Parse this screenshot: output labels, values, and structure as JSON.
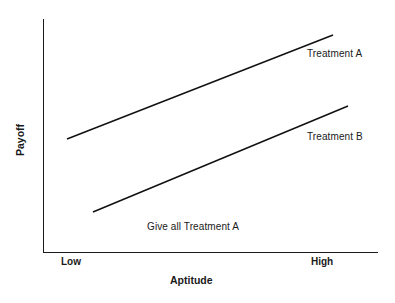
{
  "chart_data": {
    "type": "line",
    "title": "",
    "subtitle": "",
    "xlabel": "Aptitude",
    "ylabel": "Payoff",
    "xtick_labels": [
      "Low",
      "High"
    ],
    "ytick_labels": [],
    "grid": false,
    "legend_position": "inline-right",
    "xlim": [
      0,
      1
    ],
    "ylim": [
      0,
      1
    ],
    "series": [
      {
        "name": "Treatment A",
        "x": [
          0.072,
          0.861
        ],
        "y": [
          0.49,
          0.934
        ],
        "points_px": [
          [
            67,
            139
          ],
          [
            333,
            35
          ]
        ]
      },
      {
        "name": "Treatment B",
        "x": [
          0.149,
          0.905
        ],
        "y": [
          0.18,
          0.633
        ],
        "points_px": [
          [
            93,
            212
          ],
          [
            348,
            106
          ]
        ]
      }
    ],
    "annotations": [
      {
        "text": "Give all Treatment A",
        "x": 0.31,
        "y": 0.1
      }
    ]
  },
  "labels": {
    "series_a": "Treatment A",
    "series_b": "Treatment B",
    "annotation": "Give all Treatment A",
    "x_low": "Low",
    "x_high": "High",
    "x_title": "Aptitude",
    "y_title": "Payoff"
  },
  "colors": {
    "background": "#ffffff",
    "axis": "#1a1a1a",
    "line": "#111111",
    "text": "#1a1a1a"
  }
}
